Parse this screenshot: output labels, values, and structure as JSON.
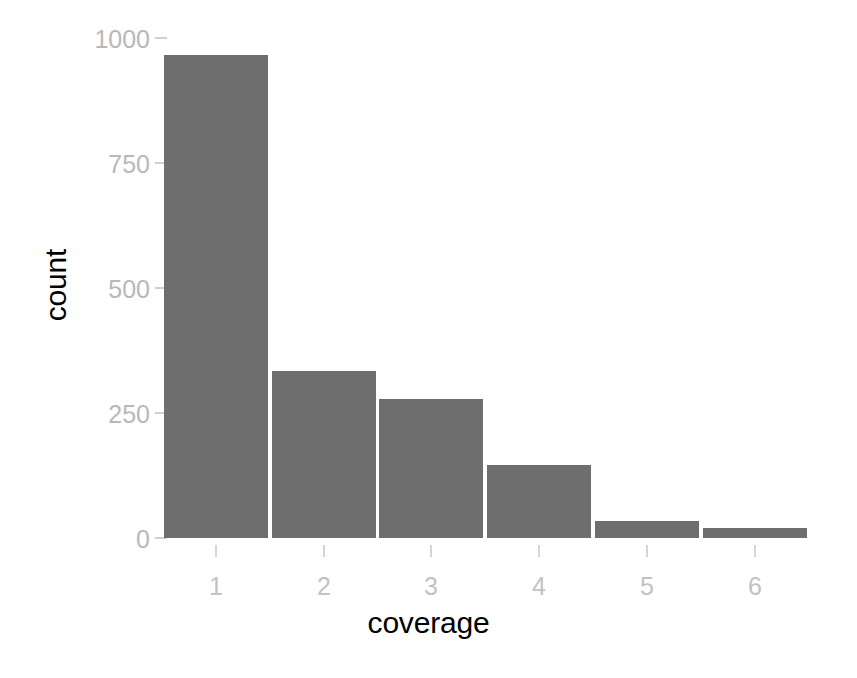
{
  "chart_data": {
    "type": "bar",
    "title": "",
    "subtitle": "",
    "xlabel": "coverage",
    "ylabel": "count",
    "categories": [
      "1",
      "2",
      "3",
      "4",
      "5",
      "6"
    ],
    "values": [
      966,
      334,
      278,
      146,
      34,
      20
    ],
    "series": [
      {
        "name": "count",
        "values": [
          966,
          334,
          278,
          146,
          34,
          20
        ]
      }
    ],
    "ylim": [
      0,
      1000
    ],
    "y_ticks": [
      "0",
      "250",
      "500",
      "750",
      "1000"
    ],
    "y_tick_values": [
      0,
      250,
      500,
      750,
      1000
    ],
    "x_ticks": [
      "1",
      "2",
      "3",
      "4",
      "5",
      "6"
    ],
    "grid": false,
    "legend": "none",
    "bar_color": "#6e6e6e",
    "axis_text_color": "#bdbdbd",
    "axis_title_color": "#000000",
    "background_color": "#ffffff"
  }
}
